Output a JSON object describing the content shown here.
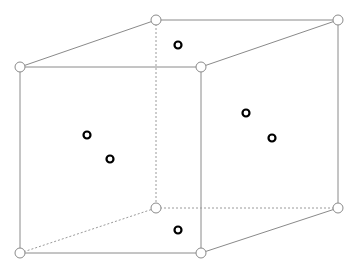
{
  "diagram": {
    "type": "cube-wireframe",
    "width": 357,
    "height": 272,
    "colors": {
      "edge": "#8a8a8a",
      "hidden_edge": "#9a9a9a",
      "vertex_fill": "#ffffff",
      "vertex_stroke": "#8a8a8a",
      "point": "#000000",
      "background": "#ffffff"
    },
    "vertices": [
      {
        "id": "front-top-left",
        "x": 20,
        "y": 67
      },
      {
        "id": "front-top-right",
        "x": 201,
        "y": 67
      },
      {
        "id": "front-bottom-left",
        "x": 20,
        "y": 253
      },
      {
        "id": "front-bottom-right",
        "x": 201,
        "y": 253
      },
      {
        "id": "back-top-left",
        "x": 156,
        "y": 20
      },
      {
        "id": "back-top-right",
        "x": 338,
        "y": 20
      },
      {
        "id": "back-bottom-left",
        "x": 156,
        "y": 208
      },
      {
        "id": "back-bottom-right",
        "x": 338,
        "y": 208
      }
    ],
    "edges": [
      {
        "from": "front-top-left",
        "to": "front-top-right",
        "hidden": false
      },
      {
        "from": "front-top-right",
        "to": "front-bottom-right",
        "hidden": false
      },
      {
        "from": "front-bottom-right",
        "to": "front-bottom-left",
        "hidden": false
      },
      {
        "from": "front-bottom-left",
        "to": "front-top-left",
        "hidden": false
      },
      {
        "from": "back-top-left",
        "to": "back-top-right",
        "hidden": false
      },
      {
        "from": "back-top-right",
        "to": "back-bottom-right",
        "hidden": false
      },
      {
        "from": "front-top-left",
        "to": "back-top-left",
        "hidden": false
      },
      {
        "from": "front-top-right",
        "to": "back-top-right",
        "hidden": false
      },
      {
        "from": "front-bottom-right",
        "to": "back-bottom-right",
        "hidden": false
      },
      {
        "from": "back-top-left",
        "to": "back-bottom-left",
        "hidden": true
      },
      {
        "from": "back-bottom-left",
        "to": "back-bottom-right",
        "hidden": true
      },
      {
        "from": "front-bottom-left",
        "to": "back-bottom-left",
        "hidden": true
      }
    ],
    "face_points": [
      {
        "face": "top",
        "x": 178,
        "y": 45
      },
      {
        "face": "front",
        "x": 87,
        "y": 135
      },
      {
        "face": "front",
        "x": 110,
        "y": 159
      },
      {
        "face": "right",
        "x": 246,
        "y": 113
      },
      {
        "face": "right",
        "x": 272,
        "y": 138
      },
      {
        "face": "bottom",
        "x": 178,
        "y": 230
      }
    ],
    "vertex_radius": 5,
    "point_radius": 3.5
  }
}
